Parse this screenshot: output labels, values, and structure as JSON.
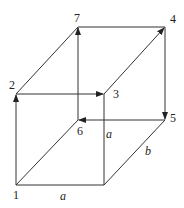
{
  "diagram": {
    "type": "cuboid-path",
    "vertices": [
      {
        "id": "1",
        "label": "1",
        "x": 16,
        "y": 185,
        "lx": 13,
        "ly": 199
      },
      {
        "id": "2",
        "label": "2",
        "x": 16,
        "y": 94,
        "lx": 9,
        "ly": 89
      },
      {
        "id": "3",
        "label": "3",
        "x": 104,
        "y": 94,
        "lx": 113,
        "ly": 98
      },
      {
        "id": "4",
        "label": "4",
        "x": 165,
        "y": 27,
        "lx": 170,
        "ly": 23
      },
      {
        "id": "5",
        "label": "5",
        "x": 165,
        "y": 120,
        "lx": 170,
        "ly": 122
      },
      {
        "id": "6",
        "label": "6",
        "x": 78,
        "y": 120,
        "lx": 77,
        "ly": 135
      },
      {
        "id": "7",
        "label": "7",
        "x": 78,
        "y": 27,
        "lx": 74,
        "ly": 22
      }
    ],
    "dimension_labels": [
      {
        "text": "a",
        "x": 60,
        "y": 200
      },
      {
        "text": "a",
        "x": 106,
        "y": 138
      },
      {
        "text": "b",
        "x": 145,
        "y": 155
      }
    ],
    "colors": {
      "line": "#333333",
      "text": "#222222"
    }
  }
}
